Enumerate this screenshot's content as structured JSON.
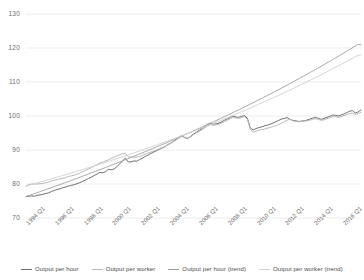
{
  "chart_data": {
    "type": "line",
    "title": "",
    "subtitle": "",
    "xlabel": "",
    "ylabel": "",
    "ylim": [
      70,
      133
    ],
    "yticks": [
      70,
      80,
      90,
      100,
      110,
      120,
      130
    ],
    "ytick_labels": [
      "70",
      "80",
      "90",
      "100",
      "110",
      "120",
      "130"
    ],
    "grid": "horizontal",
    "legend_position": "bottom",
    "x_start": "1994 Q1",
    "x_end": "2017 Q2",
    "x_interval": "quarterly",
    "xtick_labels": [
      "1994 Q1",
      "1996 Q1",
      "1998 Q1",
      "2000 Q1",
      "2002 Q1",
      "2004 Q1",
      "2006 Q1",
      "2008 Q1",
      "2010 Q1",
      "2012 Q1",
      "2014 Q1",
      "2016 Q1"
    ],
    "xtick_indices": [
      0,
      8,
      16,
      24,
      32,
      40,
      48,
      56,
      64,
      72,
      80,
      88
    ],
    "colors": {
      "output_per_hour": "#6f6f6f",
      "output_per_worker": "#b9b9b9",
      "output_per_hour_trend": "#a0a0a0",
      "output_per_worker_trend": "#cfcfcf",
      "gridline": "#ededed",
      "axis_text": "#6a6a6a"
    },
    "series": [
      {
        "name": "Output per hour",
        "color": "#6f6f6f",
        "values": [
          76.3,
          76.4,
          76.5,
          76.4,
          76.7,
          76.8,
          77.0,
          77.2,
          77.4,
          77.8,
          78.1,
          78.4,
          78.6,
          78.9,
          79.1,
          79.4,
          79.6,
          79.8,
          80.1,
          80.4,
          80.8,
          81.2,
          81.6,
          82.0,
          82.5,
          82.9,
          83.4,
          83.3,
          83.6,
          84.3,
          84.2,
          84.4,
          85.1,
          85.9,
          86.8,
          87.6,
          86.5,
          86.5,
          86.8,
          86.7,
          87.2,
          87.6,
          88.1,
          88.5,
          89.0,
          89.4,
          89.8,
          90.2,
          90.6,
          91.0,
          91.6,
          92.0,
          92.6,
          93.2,
          93.9,
          94.2,
          93.6,
          93.4,
          94.0,
          94.7,
          95.2,
          95.8,
          96.3,
          96.9,
          97.6,
          97.8,
          97.6,
          97.7,
          97.9,
          98.3,
          98.8,
          99.2,
          99.6,
          100.0,
          99.7,
          99.6,
          99.9,
          100.1,
          99.3,
          96.5,
          95.9,
          96.3,
          96.6,
          96.8,
          97.1,
          97.3,
          97.6,
          97.9,
          98.3,
          98.7,
          99.1,
          99.3,
          99.5,
          99.0,
          98.7,
          98.6,
          98.4,
          98.5,
          98.6,
          98.8,
          99.1,
          99.4,
          99.6,
          99.3,
          99.0,
          99.3,
          99.6,
          99.9,
          100.3,
          100.2,
          100.0,
          100.3,
          100.6,
          101.0,
          101.4,
          101.6,
          100.9,
          101.2,
          101.8
        ]
      },
      {
        "name": "Output per worker",
        "color": "#b9b9b9",
        "values": [
          79.4,
          79.8,
          80.0,
          80.0,
          80.0,
          80.1,
          80.2,
          80.4,
          80.6,
          80.9,
          81.1,
          81.3,
          81.5,
          81.7,
          81.9,
          82.2,
          82.4,
          82.6,
          82.9,
          83.2,
          83.6,
          84.0,
          84.4,
          84.8,
          85.3,
          85.7,
          86.1,
          86.4,
          86.8,
          87.1,
          87.5,
          87.9,
          88.3,
          88.6,
          88.9,
          89.0,
          88.0,
          87.9,
          87.9,
          87.9,
          88.1,
          88.4,
          88.8,
          89.1,
          89.4,
          89.7,
          90.0,
          90.4,
          90.7,
          91.1,
          91.6,
          92.0,
          92.5,
          93.0,
          93.6,
          94.0,
          93.7,
          93.5,
          93.9,
          94.5,
          95.0,
          95.5,
          96.0,
          96.5,
          97.1,
          97.4,
          97.3,
          97.4,
          97.6,
          98.0,
          98.4,
          98.8,
          99.2,
          99.6,
          99.4,
          99.3,
          99.6,
          99.8,
          99.0,
          96.0,
          95.2,
          95.5,
          95.8,
          96.0,
          96.2,
          96.4,
          96.6,
          96.9,
          97.2,
          97.5,
          97.9,
          98.3,
          98.8,
          99.0,
          98.6,
          98.4,
          98.3,
          98.4,
          98.5,
          98.6,
          98.8,
          99.0,
          99.2,
          99.0,
          98.7,
          98.9,
          99.2,
          99.5,
          99.8,
          99.8,
          99.6,
          99.8,
          100.1,
          100.4,
          100.7,
          100.9,
          100.4,
          100.7,
          101.1
        ]
      },
      {
        "name": "Output per hour (trend)",
        "color": "#a0a0a0",
        "trend": true,
        "values": [
          76.3,
          76.67,
          77.04,
          77.41,
          77.78,
          78.16,
          78.53,
          78.91,
          79.29,
          79.67,
          80.06,
          80.44,
          80.83,
          81.22,
          81.61,
          82.01,
          82.4,
          82.8,
          83.2,
          83.6,
          84.01,
          84.41,
          84.82,
          85.23,
          85.65,
          86.06,
          86.48,
          86.9,
          87.32,
          87.75,
          88.18,
          88.61,
          89.04,
          89.47,
          89.91,
          90.35,
          90.79,
          91.24,
          91.69,
          92.14,
          92.59,
          93.05,
          93.51,
          93.97,
          94.44,
          94.9,
          95.37,
          95.85,
          96.33,
          96.81,
          97.29,
          97.78,
          98.27,
          98.76,
          99.26,
          99.76,
          100.26,
          100.77,
          101.28,
          101.79,
          102.31,
          102.83,
          103.35,
          103.88,
          104.41,
          104.95,
          105.49,
          106.03,
          106.58,
          107.13,
          107.68,
          108.24,
          108.8,
          109.37,
          109.94,
          110.52,
          111.1,
          111.68,
          112.27,
          112.86,
          113.46,
          114.06,
          114.66,
          115.27,
          115.89,
          116.51,
          117.13,
          117.76,
          118.39,
          119.03,
          119.67,
          120.32,
          120.97,
          121.0
        ]
      },
      {
        "name": "Output per worker (trend)",
        "color": "#cfcfcf",
        "trend": true,
        "values": [
          79.4,
          79.71,
          80.02,
          80.34,
          80.66,
          80.98,
          81.3,
          81.62,
          81.95,
          82.28,
          82.61,
          82.94,
          83.28,
          83.62,
          83.96,
          84.3,
          84.65,
          85.0,
          85.35,
          85.7,
          86.06,
          86.42,
          86.78,
          87.15,
          87.52,
          87.89,
          88.26,
          88.64,
          89.02,
          89.4,
          89.79,
          90.18,
          90.57,
          90.96,
          91.36,
          91.76,
          92.17,
          92.57,
          92.98,
          93.4,
          93.81,
          94.23,
          94.66,
          95.08,
          95.51,
          95.95,
          96.38,
          96.82,
          97.27,
          97.71,
          98.16,
          98.62,
          99.08,
          99.54,
          100.0,
          100.47,
          100.95,
          101.42,
          101.9,
          102.39,
          102.88,
          103.37,
          103.87,
          104.37,
          104.87,
          105.38,
          105.9,
          106.41,
          106.94,
          107.46,
          107.99,
          108.53,
          109.07,
          109.61,
          110.16,
          110.72,
          111.27,
          111.84,
          112.4,
          112.98,
          113.55,
          114.13,
          114.72,
          115.31,
          115.91,
          116.51,
          117.11,
          117.72,
          118.0
        ]
      }
    ]
  },
  "legend": {
    "items": [
      {
        "label": "Output per hour",
        "color": "#6f6f6f"
      },
      {
        "label": "Output per worker",
        "color": "#b9b9b9"
      },
      {
        "label": "Output per hour (trend)",
        "color": "#a0a0a0"
      },
      {
        "label": "Output per worker (trend)",
        "color": "#cfcfcf"
      }
    ]
  }
}
